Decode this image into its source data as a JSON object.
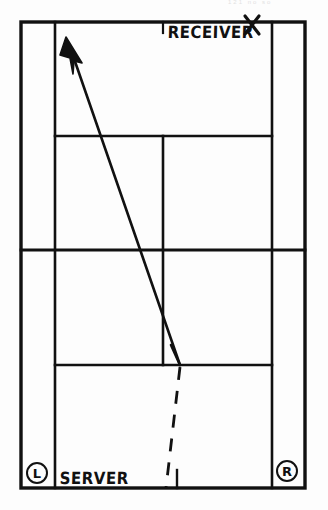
{
  "diagram": {
    "kind": "tennis-court-serve-diagram",
    "title_hint": "Tennis serve placement diagram",
    "faint_header_text": "121     no so",
    "ink_color": "#111111",
    "paper_color": "#fdfdfd",
    "labels": {
      "receiver": "RECEIVER",
      "server": "SERVER",
      "left_position": "L",
      "right_position": "R"
    },
    "court": {
      "doubles_left_x": 21,
      "singles_left_x": 55,
      "center_x": 163,
      "singles_right_x": 272,
      "doubles_right_x": 305,
      "top_baseline_y": 22,
      "top_service_line_y": 136,
      "net_y": 250,
      "bottom_service_line_y": 365,
      "bottom_baseline_y": 488
    },
    "shot": {
      "type": "serve-trajectory",
      "style_solid": "solid-with-arrowhead",
      "style_dashed": "dashed",
      "bounce_point": {
        "x": 180,
        "y": 365
      },
      "arrow_tip": {
        "x": 66,
        "y": 39
      },
      "dash_origin": {
        "x": 166,
        "y": 488
      },
      "receiver_mark": "X",
      "receiver_mark_x": 252,
      "receiver_mark_y": 24
    }
  }
}
